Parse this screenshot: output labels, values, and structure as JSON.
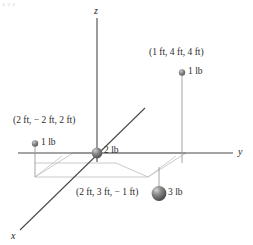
{
  "figure": {
    "title_artifact": "a a a",
    "background_color": "#ffffff",
    "axes": {
      "x_label": "x",
      "y_label": "y",
      "z_label": "z",
      "axis_color": "#4a4a4a"
    },
    "plane_color": "#b9b9b9",
    "particles": [
      {
        "id": "particle-2lb",
        "weight_label": "2 lb",
        "coord_label": "",
        "size": "medium",
        "color": "#6e6e6e"
      },
      {
        "id": "particle-1lb-upper",
        "weight_label": "1 lb",
        "coord_label": "(1 ft, 4 ft, 4 ft)",
        "size": "small",
        "color": "#7a7a7a"
      },
      {
        "id": "particle-1lb-left",
        "weight_label": "1 lb",
        "coord_label": "(2 ft, − 2 ft, 2 ft)",
        "size": "small",
        "color": "#7a7a7a"
      },
      {
        "id": "particle-3lb",
        "weight_label": "3 lb",
        "coord_label": "(2 ft, 3 ft, − 1 ft)",
        "size": "large",
        "color": "#5e5e5e"
      }
    ]
  }
}
